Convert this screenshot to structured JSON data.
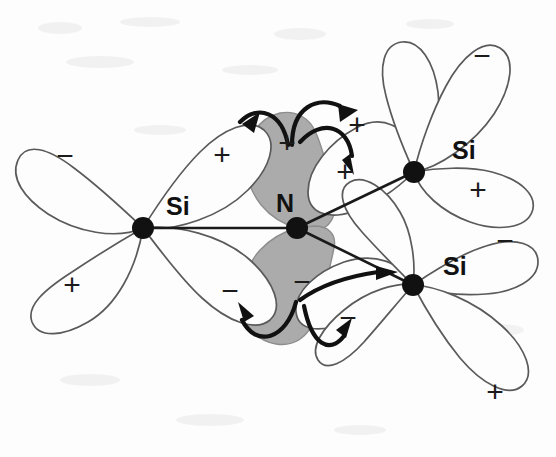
{
  "figure": {
    "background_color": "#fdfdfd",
    "shaded_orbital_color": "#ababab",
    "outline_color": "#5a5a5a",
    "atom_color": "#111111"
  },
  "atoms": [
    {
      "id": "si-left",
      "element": "Si",
      "label": "Si",
      "x": 143,
      "y": 228,
      "label_x": 166,
      "label_y": 208
    },
    {
      "id": "nitrogen",
      "element": "N",
      "label": "N",
      "x": 297,
      "y": 228,
      "label_x": 276,
      "label_y": 205
    },
    {
      "id": "si-upper-right",
      "element": "Si",
      "label": "Si",
      "x": 414,
      "y": 172,
      "label_x": 452,
      "label_y": 152
    },
    {
      "id": "si-lower-right",
      "element": "Si",
      "label": "Si",
      "x": 413,
      "y": 285,
      "label_x": 443,
      "label_y": 268
    }
  ],
  "bonds": [
    {
      "id": "bond-si-left-n",
      "from": "si-left",
      "to": "nitrogen"
    },
    {
      "id": "bond-n-si-upper-right",
      "from": "nitrogen",
      "to": "si-upper-right"
    },
    {
      "id": "bond-n-si-lower-right",
      "from": "nitrogen",
      "to": "si-lower-right"
    }
  ],
  "signs": [
    {
      "id": "sign-left-si-upper-left",
      "text": "−",
      "x": 65,
      "y": 158
    },
    {
      "id": "sign-left-si-lower-left",
      "text": "+",
      "x": 72,
      "y": 287
    },
    {
      "id": "sign-left-si-upper-right",
      "text": "+",
      "x": 222,
      "y": 157
    },
    {
      "id": "sign-left-si-lower-right",
      "text": "−",
      "x": 230,
      "y": 293
    },
    {
      "id": "sign-n-upper-lobe",
      "text": "+",
      "x": 287,
      "y": 145
    },
    {
      "id": "sign-n-lower-lobe",
      "text": "−",
      "x": 302,
      "y": 284
    },
    {
      "id": "sign-si-ur-toward-n",
      "text": "+",
      "x": 345,
      "y": 174
    },
    {
      "id": "sign-si-ur-upper",
      "text": "+",
      "x": 357,
      "y": 127
    },
    {
      "id": "sign-si-lr-toward-n",
      "text": "−",
      "x": 348,
      "y": 320
    },
    {
      "id": "sign-si-ur-top-lobe",
      "text": "−",
      "x": 482,
      "y": 58
    },
    {
      "id": "sign-si-ur-right-lobe",
      "text": "+",
      "x": 478,
      "y": 192
    },
    {
      "id": "sign-si-lr-right-lobe",
      "text": "−",
      "x": 505,
      "y": 243
    },
    {
      "id": "sign-si-lr-bottom-lobe",
      "text": "+",
      "x": 495,
      "y": 394
    }
  ],
  "arrows": [
    {
      "id": "arrow-n-to-left-si",
      "direction": "from nitrogen upper lobe toward left silicon lobe"
    },
    {
      "id": "arrow-n-to-upper-right-si",
      "direction": "from nitrogen upper lobe toward upper-right silicon lobe"
    },
    {
      "id": "arrow-n-to-right-inner",
      "direction": "from nitrogen upper lobe down-right into inner lobe"
    },
    {
      "id": "arrow-n-lower-to-left",
      "direction": "from nitrogen lower lobe toward lower-left lobe"
    },
    {
      "id": "arrow-n-lower-to-right",
      "direction": "from nitrogen lower lobe toward lower-right silicon"
    },
    {
      "id": "arrow-n-lower-to-center",
      "direction": "from nitrogen lower lobe up into center-right lobe"
    }
  ]
}
